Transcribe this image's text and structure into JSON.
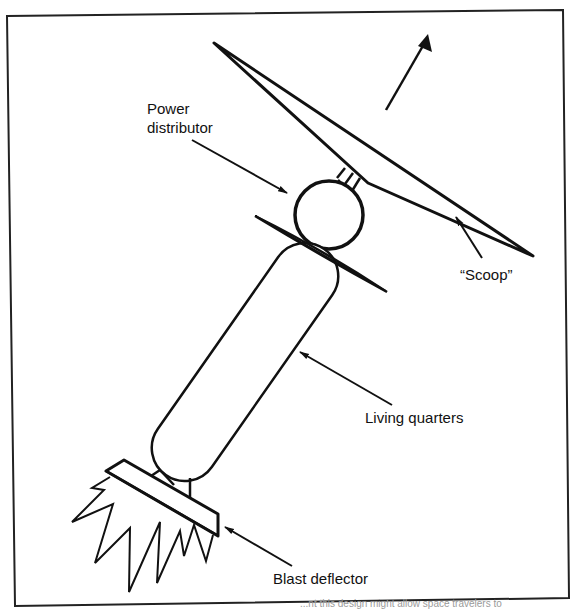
{
  "figure": {
    "labels": {
      "power_distributor_line1": "Power",
      "power_distributor_line2": "distributor",
      "scoop": "“Scoop”",
      "living_quarters": "Living quarters",
      "blast_deflector": "Blast deflector"
    },
    "caption_fragment": "...nt this design might allow space travelers to",
    "colors": {
      "ink": "#111111",
      "background": "#ffffff",
      "frame": "#222222"
    },
    "parts": [
      "scoop",
      "power-distributor",
      "heat-shield-disc",
      "living-quarters",
      "blast-deflector",
      "exhaust-flames",
      "direction-arrow"
    ]
  }
}
